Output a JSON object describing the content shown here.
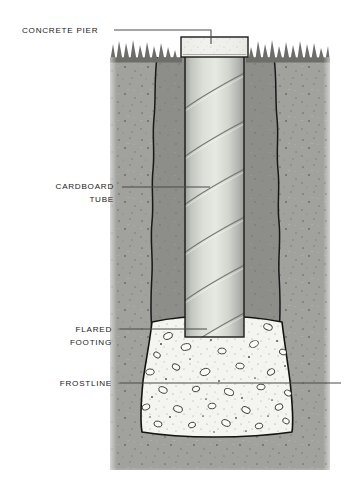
{
  "figure": {
    "type": "technical-cross-section-illustration",
    "width": 348,
    "height": 484
  },
  "callouts": [
    {
      "id": "concrete-pier",
      "line1": "CONCRETE PIER",
      "line2": "",
      "text_anchor": "start",
      "text_x": 22,
      "text_y": 33,
      "leader": {
        "x1": 114,
        "y1": 30,
        "x2": 211,
        "y2": 30,
        "drop_x": 211,
        "drop_y": 44
      }
    },
    {
      "id": "cardboard-tube",
      "line1": "CARDBOARD",
      "line2": "TUBE",
      "text_anchor": "end",
      "text_x": 114,
      "text_y": 189,
      "leader": {
        "x1": 122,
        "y1": 187,
        "x2": 210,
        "y2": 187,
        "drop_x": 0,
        "drop_y": 0
      }
    },
    {
      "id": "flared-footing",
      "line1": "FLARED",
      "line2": "FOOTING",
      "text_anchor": "end",
      "text_x": 112,
      "text_y": 332,
      "leader": {
        "x1": 120,
        "y1": 329,
        "x2": 207,
        "y2": 329,
        "drop_x": 0,
        "drop_y": 0
      }
    },
    {
      "id": "frostline",
      "line1": "FROSTLINE",
      "line2": "",
      "text_anchor": "end",
      "text_x": 112,
      "text_y": 386,
      "leader": {
        "x1": 120,
        "y1": 383,
        "x2": 341,
        "y2": 383,
        "drop_x": 0,
        "drop_y": 0
      }
    }
  ],
  "parts": {
    "pier_cap": {
      "label": "concrete pier cap",
      "fill": "#ebebe8"
    },
    "tube": {
      "label": "cardboard form tube",
      "fill": "#d6d8d2"
    },
    "footing": {
      "label": "flared concrete footing",
      "fill": "#f2f2ee"
    },
    "soil": {
      "label": "undisturbed soil",
      "fill": "#a9a9a5"
    },
    "backfill": {
      "label": "excavation backfill",
      "fill": "#8a8a86"
    },
    "grass": {
      "label": "grass at grade",
      "fill": "#6e6e6a"
    },
    "outline": {
      "label": "ink outline",
      "stroke": "#111111"
    }
  },
  "colors": {
    "background": "#ffffff",
    "text": "#1b1b1b",
    "leader_line": "#4a4a4a"
  }
}
